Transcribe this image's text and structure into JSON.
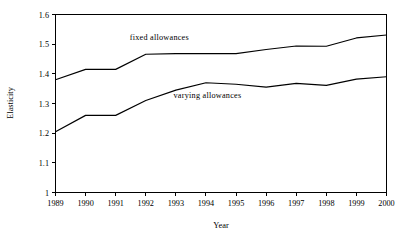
{
  "chart_data": {
    "type": "line",
    "title": "",
    "xlabel": "Year",
    "ylabel": "Elasticity",
    "x": [
      1989,
      1990,
      1991,
      1992,
      1993,
      1994,
      1995,
      1996,
      1997,
      1998,
      1999,
      2000
    ],
    "xtick_labels": [
      "1989",
      "1990",
      "1991",
      "1992",
      "1993",
      "1994",
      "1995",
      "1996",
      "1997",
      "1998",
      "1999",
      "2000"
    ],
    "ytick_labels": [
      "1",
      "1.1",
      "1.2",
      "1.3",
      "1.4",
      "1.5",
      "1.6"
    ],
    "ytick_values": [
      1,
      1.1,
      1.2,
      1.3,
      1.4,
      1.5,
      1.6
    ],
    "ylim": [
      1,
      1.6
    ],
    "xlim": [
      1989,
      2000
    ],
    "grid": false,
    "legend_position": "inline-annotation",
    "line_color": "#000000",
    "background_color": "#ffffff",
    "series": [
      {
        "name": "fixed allowances",
        "label": "fixed allowances",
        "values": [
          1.38,
          1.415,
          1.415,
          1.466,
          1.468,
          1.468,
          1.468,
          1.482,
          1.494,
          1.493,
          1.521,
          1.531
        ],
        "annotation_x": 1992.45,
        "annotation_y": 1.513
      },
      {
        "name": "varying allowances",
        "label": "varying allowances",
        "values": [
          1.205,
          1.26,
          1.26,
          1.31,
          1.345,
          1.37,
          1.365,
          1.355,
          1.368,
          1.361,
          1.382,
          1.39
        ],
        "annotation_x": 1994.05,
        "annotation_y": 1.318
      }
    ]
  }
}
